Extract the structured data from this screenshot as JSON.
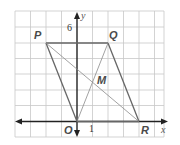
{
  "diagram": {
    "type": "coordinate-geometry",
    "axes": {
      "x_label": "x",
      "y_label": "y",
      "tick_labels": {
        "y": "6",
        "x": "1"
      }
    },
    "grid": {
      "x_min": -4,
      "x_max": 6,
      "y_min": -1,
      "y_max": 7,
      "unit_px": 15.5
    },
    "points": [
      {
        "name": "P",
        "label": "P",
        "x": -2,
        "y": 5
      },
      {
        "name": "Q",
        "label": "Q",
        "x": 2,
        "y": 5
      },
      {
        "name": "O",
        "label": "O",
        "x": 0,
        "y": 0
      },
      {
        "name": "R",
        "label": "R",
        "x": 4,
        "y": 0
      },
      {
        "name": "M",
        "label": "M",
        "x": 1,
        "y": 2.5
      }
    ],
    "segments": [
      {
        "from": "P",
        "to": "Q",
        "style": "side"
      },
      {
        "from": "Q",
        "to": "R",
        "style": "side"
      },
      {
        "from": "R",
        "to": "O",
        "style": "side"
      },
      {
        "from": "O",
        "to": "P",
        "style": "side"
      },
      {
        "from": "P",
        "to": "R",
        "style": "diagonal"
      },
      {
        "from": "O",
        "to": "Q",
        "style": "diagonal"
      }
    ],
    "colors": {
      "grid": "#c8c8c8",
      "axis": "#222222",
      "side": "#666666",
      "diagonal": "#8a8a8a",
      "label": "#4a4a4a"
    }
  }
}
